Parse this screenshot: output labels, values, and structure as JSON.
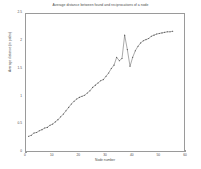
{
  "chart_data": {
    "type": "line",
    "title": "Average distance between found and reciprocations of a node",
    "xlabel": "Node number",
    "ylabel": "Average distance (in paths)",
    "xlim": [
      0,
      60
    ],
    "ylim": [
      0,
      2.5
    ],
    "grid": false,
    "legend": null,
    "marker": "point",
    "line_color": "#555555",
    "xticks": [
      "0",
      "10",
      "20",
      "30",
      "40",
      "50",
      "60"
    ],
    "xtick_values": [
      0,
      10,
      20,
      30,
      40,
      50,
      60
    ],
    "yticks": [
      "0",
      "0.5",
      "1",
      "1.5",
      "2",
      "2.5"
    ],
    "ytick_values": [
      0,
      0.5,
      1,
      1.5,
      2,
      2.5
    ],
    "x": [
      1,
      2,
      3,
      4,
      5,
      6,
      7,
      8,
      9,
      10,
      11,
      12,
      13,
      14,
      15,
      16,
      17,
      18,
      19,
      20,
      21,
      22,
      23,
      24,
      25,
      26,
      27,
      28,
      29,
      30,
      31,
      32,
      33,
      34,
      35,
      36,
      37,
      38,
      39,
      40,
      41,
      42,
      43,
      44,
      45,
      46,
      47,
      48,
      49,
      50,
      51,
      52,
      53,
      54,
      55
    ],
    "values": [
      0.3,
      0.32,
      0.36,
      0.37,
      0.4,
      0.42,
      0.45,
      0.46,
      0.5,
      0.52,
      0.56,
      0.6,
      0.65,
      0.7,
      0.76,
      0.82,
      0.88,
      0.93,
      0.97,
      1.0,
      1.02,
      1.04,
      1.08,
      1.12,
      1.18,
      1.22,
      1.26,
      1.3,
      1.32,
      1.38,
      1.44,
      1.52,
      1.58,
      1.72,
      1.66,
      1.7,
      2.12,
      1.86,
      1.56,
      1.72,
      1.84,
      1.92,
      1.98,
      2.02,
      2.04,
      2.06,
      2.1,
      2.12,
      2.14,
      2.15,
      2.16,
      2.17,
      2.18,
      2.18,
      2.19
    ]
  }
}
